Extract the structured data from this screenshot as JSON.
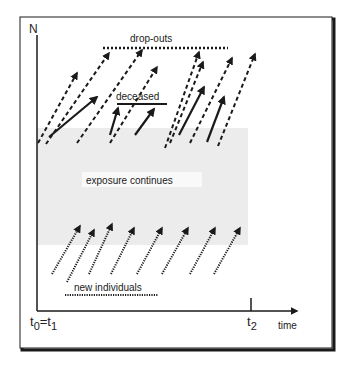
{
  "figure": {
    "y_axis_label": "N",
    "x_axis_label": "time",
    "x_ticks": {
      "start": "t0=t1",
      "end": "t2"
    },
    "start_label": {
      "t": "t",
      "sub0": "0",
      "eq": "=t",
      "sub1": "1"
    },
    "end_label": {
      "t": "t",
      "sub": "2"
    },
    "region_label": "exposure continues",
    "annotations": {
      "dropouts": "drop-outs",
      "deceased": "deceased",
      "new_individuals": "new individuals"
    },
    "colors": {
      "frame": "#1a1a1a",
      "exposure_region": "#ececec",
      "ink": "#1a1a1a"
    }
  }
}
